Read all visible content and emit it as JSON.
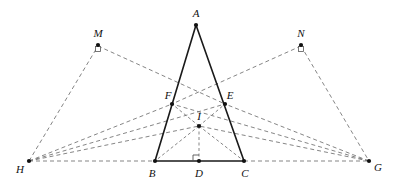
{
  "figure": {
    "canvas": {
      "width": 393,
      "height": 195,
      "background": "#ffffff"
    },
    "colors": {
      "solid_stroke": "#1a1a1a",
      "dashed_stroke": "#6f6f6f",
      "vertex_fill": "#111111",
      "label_color": "#111111"
    },
    "points": [
      {
        "id": "A",
        "label": "A",
        "x": 196,
        "y": 25,
        "label_x": 196,
        "label_y": 13,
        "dot": true
      },
      {
        "id": "M",
        "label": "M",
        "x": 98,
        "y": 46,
        "label_x": 98,
        "label_y": 33,
        "dot": true
      },
      {
        "id": "N",
        "label": "N",
        "x": 301,
        "y": 46,
        "label_x": 301,
        "label_y": 33,
        "dot": true
      },
      {
        "id": "F",
        "label": "F",
        "x": 172,
        "y": 104,
        "label_x": 168,
        "label_y": 95,
        "dot": true
      },
      {
        "id": "E",
        "label": "E",
        "x": 225,
        "y": 104,
        "label_x": 230,
        "label_y": 95,
        "dot": true
      },
      {
        "id": "I",
        "label": "I",
        "x": 199,
        "y": 126,
        "label_x": 199,
        "label_y": 116,
        "dot": true
      },
      {
        "id": "H",
        "label": "H",
        "x": 29,
        "y": 161,
        "label_x": 20,
        "label_y": 169,
        "dot": true
      },
      {
        "id": "B",
        "label": "B",
        "x": 155,
        "y": 161,
        "label_x": 152,
        "label_y": 173,
        "dot": true
      },
      {
        "id": "D",
        "label": "D",
        "x": 199,
        "y": 161,
        "label_x": 199,
        "label_y": 173,
        "dot": true
      },
      {
        "id": "C",
        "label": "C",
        "x": 244,
        "y": 161,
        "label_x": 245,
        "label_y": 173,
        "dot": true
      },
      {
        "id": "G",
        "label": "G",
        "x": 369,
        "y": 161,
        "label_x": 378,
        "label_y": 167,
        "dot": true
      }
    ],
    "solid_segments": [
      {
        "name": "segment-AB",
        "from": "A",
        "to": "B"
      },
      {
        "name": "segment-AC",
        "from": "A",
        "to": "C"
      },
      {
        "name": "segment-BC",
        "from": "B",
        "to": "C"
      }
    ],
    "dashed_segments": [
      {
        "name": "segment-HG-baseline-left",
        "from": "H",
        "to": "B"
      },
      {
        "name": "segment-CG-baseline-right",
        "from": "C",
        "to": "G"
      },
      {
        "name": "segment-HM",
        "from": "H",
        "to": "M"
      },
      {
        "name": "segment-ME",
        "from": "M",
        "to": "E"
      },
      {
        "name": "segment-NG",
        "from": "N",
        "to": "G"
      },
      {
        "name": "segment-NF",
        "from": "N",
        "to": "F"
      },
      {
        "name": "segment-HF",
        "from": "H",
        "to": "F"
      },
      {
        "name": "segment-HI",
        "from": "H",
        "to": "I"
      },
      {
        "name": "segment-HE",
        "from": "H",
        "to": "E"
      },
      {
        "name": "segment-GE",
        "from": "G",
        "to": "E"
      },
      {
        "name": "segment-GI",
        "from": "G",
        "to": "I"
      },
      {
        "name": "segment-GF",
        "from": "G",
        "to": "F"
      },
      {
        "name": "segment-IB",
        "from": "I",
        "to": "B"
      },
      {
        "name": "segment-IC",
        "from": "I",
        "to": "C"
      },
      {
        "name": "segment-IF",
        "from": "I",
        "to": "F"
      },
      {
        "name": "segment-IE",
        "from": "I",
        "to": "E"
      },
      {
        "name": "segment-ID",
        "from": "I",
        "to": "D"
      }
    ],
    "right_angle_marks": [
      {
        "name": "right-angle-mark-D",
        "at": "D",
        "x": 199,
        "y": 161,
        "orientation": "up-left",
        "size": 6
      },
      {
        "name": "right-angle-mark-M",
        "at": "M",
        "x": 98,
        "y": 46,
        "orientation": "below",
        "size": 5
      },
      {
        "name": "right-angle-mark-N",
        "at": "N",
        "x": 301,
        "y": 46,
        "orientation": "below",
        "size": 5
      }
    ]
  }
}
